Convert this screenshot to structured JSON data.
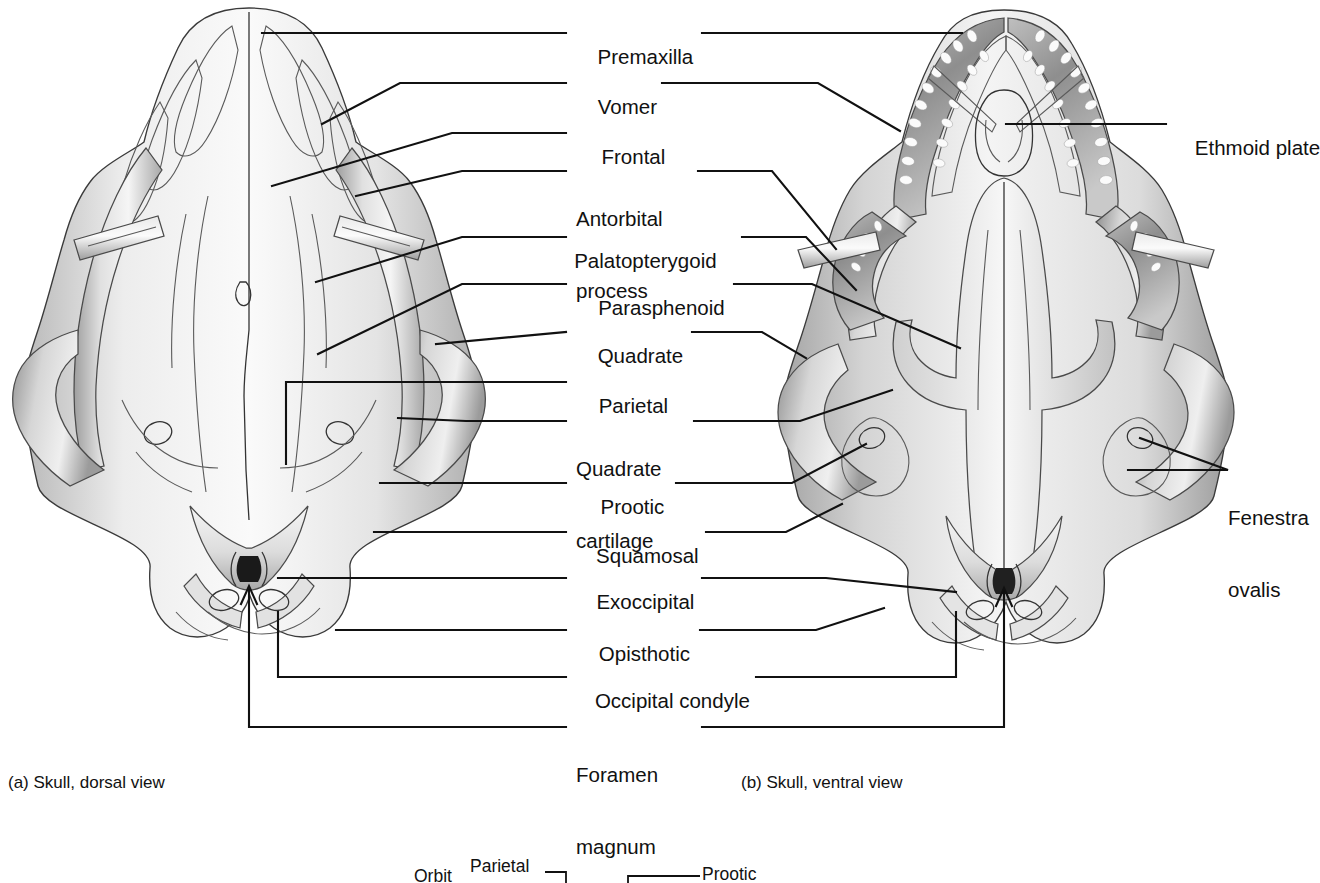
{
  "figure": {
    "kind": "anatomical-plate",
    "panels": [
      {
        "id": "a",
        "caption": "(a) Skull, dorsal view"
      },
      {
        "id": "b",
        "caption": "(b) Skull, ventral view"
      }
    ]
  },
  "center_labels": [
    {
      "key": "premaxilla",
      "text": "Premaxilla",
      "lines": [
        "Premaxilla"
      ]
    },
    {
      "key": "vomer",
      "text": "Vomer",
      "lines": [
        "Vomer"
      ]
    },
    {
      "key": "frontal",
      "text": "Frontal",
      "lines": [
        "Frontal"
      ]
    },
    {
      "key": "antorbital-process",
      "text": "Antorbital process",
      "lines": [
        "Antorbital",
        "process"
      ]
    },
    {
      "key": "palatopterygoid",
      "text": "Palatopterygoid",
      "lines": [
        "Palatopterygoid"
      ]
    },
    {
      "key": "parasphenoid",
      "text": "Parasphenoid",
      "lines": [
        "Parasphenoid"
      ]
    },
    {
      "key": "quadrate",
      "text": "Quadrate",
      "lines": [
        "Quadrate"
      ]
    },
    {
      "key": "parietal",
      "text": "Parietal",
      "lines": [
        "Parietal"
      ]
    },
    {
      "key": "quadrate-cartilage",
      "text": "Quadrate cartilage",
      "lines": [
        "Quadrate",
        "cartilage"
      ]
    },
    {
      "key": "prootic",
      "text": "Prootic",
      "lines": [
        "Prootic"
      ]
    },
    {
      "key": "squamosal",
      "text": "Squamosal",
      "lines": [
        "Squamosal"
      ]
    },
    {
      "key": "exoccipital",
      "text": "Exoccipital",
      "lines": [
        "Exoccipital"
      ]
    },
    {
      "key": "opisthotic",
      "text": "Opisthotic",
      "lines": [
        "Opisthotic"
      ]
    },
    {
      "key": "occipital-condyle",
      "text": "Occipital condyle",
      "lines": [
        "Occipital condyle"
      ]
    },
    {
      "key": "foramen-magnum",
      "text": "Foramen magnum",
      "lines": [
        "Foramen",
        "magnum"
      ]
    }
  ],
  "right_labels": [
    {
      "key": "ethmoid-plate",
      "text": "Ethmoid plate",
      "lines": [
        "Ethmoid plate"
      ]
    },
    {
      "key": "fenestra-ovalis",
      "text": "Fenestra ovalis",
      "lines": [
        "Fenestra",
        "ovalis"
      ]
    }
  ],
  "cut_figure": {
    "note": "partially visible third figure at bottom edge",
    "labels": [
      {
        "key": "orbit",
        "text": "Orbit"
      },
      {
        "key": "parietal",
        "text": "Parietal"
      },
      {
        "key": "prootic",
        "text": "Prootic"
      }
    ]
  },
  "colors": {
    "ink": "#111111",
    "background": "#ffffff",
    "bone_light": "#f2f2f2",
    "bone_mid": "#d8d8d8",
    "bone_shadow": "#9a9a9a",
    "bone_dark": "#6a6a6a"
  }
}
